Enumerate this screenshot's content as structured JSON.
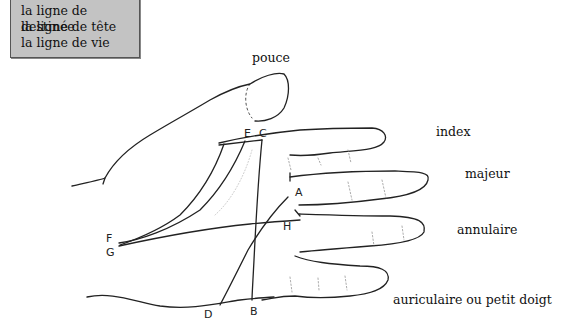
{
  "legend": {
    "items": [
      {
        "label": "la ligne de destinée"
      },
      {
        "label": "la ligne de tête"
      },
      {
        "label": "la ligne de vie"
      }
    ]
  },
  "fingers": {
    "thumb": "pouce",
    "index": "index",
    "middle": "majeur",
    "ring": "annulaire",
    "little": "auriculaire ou petit doigt"
  },
  "points": {
    "A": "A",
    "B": "B",
    "C": "C",
    "D": "D",
    "E": "E",
    "F": "F",
    "G": "G",
    "H": "H"
  }
}
